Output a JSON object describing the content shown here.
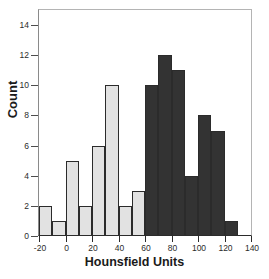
{
  "chart_data": {
    "type": "bar",
    "title": "",
    "xlabel": "Hounsfield Units",
    "ylabel": "Count",
    "xlim": [
      -20,
      140
    ],
    "ylim": [
      0,
      15
    ],
    "grid": false,
    "legend": null,
    "bin_width": 10,
    "x_ticks": [
      -20,
      0,
      20,
      40,
      60,
      80,
      100,
      120,
      140
    ],
    "x_tick_labels": [
      "-20",
      "0",
      "20",
      "40",
      "60",
      "80",
      "100",
      "120",
      "140"
    ],
    "y_ticks": [
      0,
      2,
      4,
      6,
      8,
      10,
      12,
      14
    ],
    "y_tick_labels": [
      "0",
      "2",
      "4",
      "6",
      "8",
      "10",
      "12",
      "14"
    ],
    "colors": {
      "light_bar_fill": "#e2e2e2",
      "dark_bar_fill": "#333333",
      "bar_edge": "#2b2b2b",
      "frame": "#b4b4b4",
      "text": "#1a1a1a"
    },
    "bins": [
      {
        "x0": -20,
        "x1": -10,
        "value": 2,
        "group": "light"
      },
      {
        "x0": -10,
        "x1": 0,
        "value": 1,
        "group": "light"
      },
      {
        "x0": 0,
        "x1": 10,
        "value": 5,
        "group": "light"
      },
      {
        "x0": 10,
        "x1": 20,
        "value": 2,
        "group": "light"
      },
      {
        "x0": 20,
        "x1": 30,
        "value": 6,
        "group": "light"
      },
      {
        "x0": 30,
        "x1": 40,
        "value": 10,
        "group": "light"
      },
      {
        "x0": 40,
        "x1": 50,
        "value": 2,
        "group": "light"
      },
      {
        "x0": 50,
        "x1": 60,
        "value": 3,
        "group": "light"
      },
      {
        "x0": 60,
        "x1": 70,
        "value": 10,
        "group": "dark"
      },
      {
        "x0": 70,
        "x1": 80,
        "value": 12,
        "group": "dark"
      },
      {
        "x0": 80,
        "x1": 90,
        "value": 11,
        "group": "dark"
      },
      {
        "x0": 90,
        "x1": 100,
        "value": 4,
        "group": "dark"
      },
      {
        "x0": 100,
        "x1": 110,
        "value": 8,
        "group": "dark"
      },
      {
        "x0": 110,
        "x1": 120,
        "value": 7,
        "group": "dark"
      },
      {
        "x0": 120,
        "x1": 130,
        "value": 1,
        "group": "dark"
      }
    ]
  }
}
